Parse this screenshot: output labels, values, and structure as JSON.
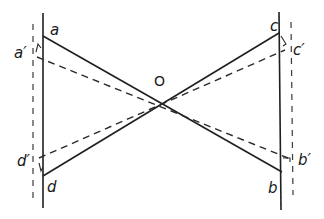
{
  "diagram": {
    "type": "geometric-construction",
    "center_point": {
      "label": "O",
      "x": 161,
      "y": 89
    },
    "points": {
      "a": {
        "label": "a",
        "x": 43,
        "y": 36
      },
      "a_prime": {
        "label": "a′",
        "x": 35,
        "y": 57
      },
      "b": {
        "label": "b",
        "x": 282,
        "y": 172
      },
      "b_prime": {
        "label": "b′",
        "x": 291,
        "y": 158
      },
      "c": {
        "label": "c",
        "x": 279,
        "y": 33
      },
      "c_prime": {
        "label": "c′",
        "x": 288,
        "y": 50
      },
      "d": {
        "label": "d",
        "x": 43,
        "y": 176
      },
      "d_prime": {
        "label": "d′",
        "x": 37,
        "y": 158
      }
    },
    "lines": {
      "solid": [
        {
          "from": "a",
          "to": "b"
        },
        {
          "from": "d",
          "to": "c"
        },
        {
          "name": "left-vertical",
          "x": 43,
          "y1": 13,
          "y2": 208
        },
        {
          "name": "right-vertical",
          "x": 280,
          "y1": 12,
          "y2": 210
        }
      ],
      "dashed": [
        {
          "from": "a_prime",
          "to": "b_prime"
        },
        {
          "from": "d_prime",
          "to": "c_prime"
        },
        {
          "name": "left-dashed-vertical",
          "x": 33,
          "y1": 24,
          "y2": 200
        },
        {
          "name": "right-dashed-vertical",
          "x": 292,
          "y1": 22,
          "y2": 195
        }
      ]
    }
  },
  "labels": {
    "a": "a",
    "a_prime": "a′",
    "b": "b",
    "b_prime": "b′",
    "c": "c",
    "c_prime": "c′",
    "d": "d",
    "d_prime": "d′",
    "o": "O"
  }
}
